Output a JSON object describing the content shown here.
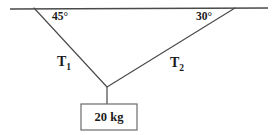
{
  "diagram": {
    "colors": {
      "line": "#4a4a4a",
      "text": "#1a1a1a",
      "background": "#ffffff"
    },
    "ceiling": {
      "name": "horizontal-support-line",
      "x1": 10,
      "y1": 9,
      "x2": 268,
      "y2": 8
    },
    "cables": [
      {
        "name": "cable-left",
        "tension_label": "T",
        "tension_subscript": "1",
        "angle_label": "45°",
        "x1": 34,
        "y1": 8,
        "x2": 107,
        "y2": 87
      },
      {
        "name": "cable-right",
        "tension_label": "T",
        "tension_subscript": "2",
        "angle_label": "30°",
        "x1": 235,
        "y1": 8,
        "x2": 107,
        "y2": 87
      }
    ],
    "hanger": {
      "name": "vertical-hanger-line",
      "x1": 107,
      "y1": 87,
      "x2": 107,
      "y2": 104
    },
    "mass_box": {
      "name": "mass-block",
      "label": "20 kg",
      "x": 81,
      "y": 104,
      "width": 56,
      "height": 26
    }
  }
}
